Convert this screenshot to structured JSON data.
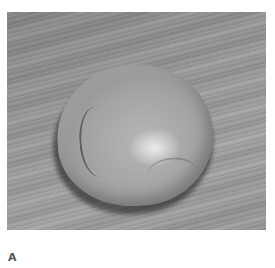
{
  "figure": {
    "panel_label": "A",
    "image_description": "Grayscale photo of a round ball of dough resting on a wooden surface with diagonal grain",
    "colors": {
      "background": "#ffffff",
      "wood_mid": "#9c9c9c",
      "dough_mid": "#a4a4a4",
      "label": "#555555"
    }
  }
}
